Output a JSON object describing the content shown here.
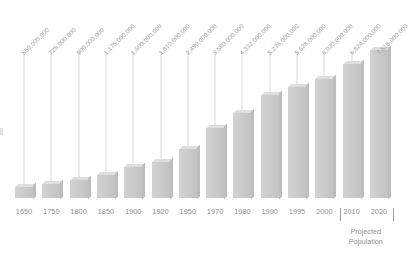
{
  "chart_data": {
    "type": "bar",
    "title": "",
    "subtitle": "",
    "xlabel": "",
    "ylabel": "",
    "grid": false,
    "legend": null,
    "ylim": [
      0,
      7518000000
    ],
    "categories": [
      "1650",
      "1750",
      "1800",
      "1850",
      "1900",
      "1920",
      "1950",
      "1970",
      "1980",
      "1990",
      "1995",
      "2000",
      "2010",
      "2020"
    ],
    "values": [
      550000000,
      725000000,
      900000000,
      1175000000,
      1600000000,
      1810000000,
      2490000000,
      3580000000,
      4332000000,
      5236000000,
      5628000000,
      6020600000,
      6824000000,
      7518000000
    ],
    "value_labels": [
      "550,000,000",
      "725,000,000",
      "900,000,000",
      "1,175,000,000",
      "1,600,000,000",
      "1,810,000,000",
      "2,490,000,000",
      "3,580,000,000",
      "4,332,000,000",
      "5,236,000,000",
      "5,628,000,000",
      "6,020,600,000",
      "6,824,000,000",
      "7,518,000,000"
    ],
    "annotations": [
      {
        "text": "Projected Population",
        "line1": "Projected",
        "line2": "Population",
        "covers": [
          "2010",
          "2020"
        ]
      }
    ],
    "colors": {
      "bar_front": "#cacaca",
      "bar_top": "#dedede",
      "bar_side": "#bdbdbd",
      "leader_line": "#d9d9d9",
      "label_text": "#9a9a9a",
      "axis_text": "#8f8f8f",
      "background": "#ffffff"
    }
  },
  "annotation": {
    "projected_line1": "Projected",
    "projected_line2": "Population"
  }
}
